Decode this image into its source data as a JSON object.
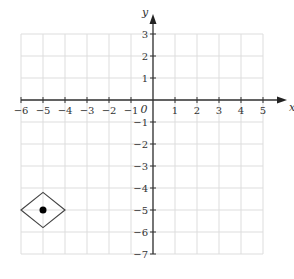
{
  "chart_data": {
    "type": "scatter",
    "title": "",
    "xlabel": "x",
    "ylabel": "y",
    "origin_label": "0",
    "xlim": [
      -6,
      5
    ],
    "ylim": [
      -7,
      3
    ],
    "grid": true,
    "x_ticks": [
      "−6",
      "−5",
      "−4",
      "−3",
      "−2",
      "−1",
      "1",
      "2",
      "3",
      "4",
      "5"
    ],
    "y_ticks": [
      "3",
      "2",
      "1",
      "−1",
      "−2",
      "−3",
      "−4",
      "−5",
      "−6",
      "−7"
    ],
    "points": [
      {
        "x": -5,
        "y": -5,
        "marker": "filled-circle"
      }
    ],
    "shapes": [
      {
        "type": "rhombus",
        "center": [
          -5,
          -5
        ],
        "vertices": [
          [
            -6,
            -5
          ],
          [
            -5,
            -4.2
          ],
          [
            -4,
            -5
          ],
          [
            -5,
            -5.8
          ]
        ]
      }
    ]
  }
}
